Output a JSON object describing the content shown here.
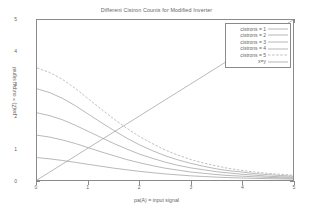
{
  "chart_data": {
    "type": "line",
    "title": "Different Cistron Counts for Modified Inverter",
    "xlabel": "pa(A) = input signal",
    "ylabel": "pa(Z) = output signal",
    "xlim": [
      0,
      5
    ],
    "ylim": [
      0,
      5
    ],
    "xticks": [
      "0",
      "1",
      "2",
      "3",
      "4",
      "5"
    ],
    "yticks": [
      "0",
      "1",
      "2",
      "3",
      "4",
      "5"
    ],
    "grid": false,
    "legend_position": "top-right",
    "x": [
      0,
      0.25,
      0.5,
      0.75,
      1,
      1.25,
      1.5,
      1.75,
      2,
      2.25,
      2.5,
      2.75,
      3,
      3.25,
      3.5,
      3.75,
      4,
      4.25,
      4.5,
      4.75,
      5
    ],
    "series": [
      {
        "name": "cistrons = 1",
        "linestyle": "solid",
        "color": "#9a9a9a",
        "values": [
          0.7,
          0.66,
          0.61,
          0.55,
          0.49,
          0.43,
          0.37,
          0.32,
          0.27,
          0.23,
          0.19,
          0.16,
          0.13,
          0.11,
          0.09,
          0.075,
          0.062,
          0.051,
          0.042,
          0.035,
          0.029
        ]
      },
      {
        "name": "cistrons = 2",
        "linestyle": "solid",
        "color": "#9a9a9a",
        "values": [
          1.4,
          1.34,
          1.25,
          1.14,
          1.01,
          0.88,
          0.76,
          0.64,
          0.54,
          0.45,
          0.37,
          0.31,
          0.25,
          0.21,
          0.17,
          0.14,
          0.12,
          0.1,
          0.082,
          0.068,
          0.057
        ]
      },
      {
        "name": "cistrons = 3",
        "linestyle": "solid",
        "color": "#9a9a9a",
        "values": [
          2.1,
          2.01,
          1.88,
          1.71,
          1.52,
          1.33,
          1.14,
          0.97,
          0.81,
          0.68,
          0.56,
          0.46,
          0.38,
          0.32,
          0.26,
          0.22,
          0.18,
          0.15,
          0.12,
          0.1,
          0.086
        ]
      },
      {
        "name": "cistrons = 4",
        "linestyle": "solid",
        "color": "#9a9a9a",
        "values": [
          2.85,
          2.73,
          2.55,
          2.32,
          2.06,
          1.8,
          1.55,
          1.31,
          1.1,
          0.92,
          0.76,
          0.63,
          0.52,
          0.43,
          0.35,
          0.29,
          0.25,
          0.2,
          0.17,
          0.14,
          0.12
        ]
      },
      {
        "name": "cistrons = 5",
        "linestyle": "dashed",
        "color": "#a5a5a5",
        "values": [
          3.5,
          3.36,
          3.14,
          2.86,
          2.54,
          2.22,
          1.91,
          1.62,
          1.36,
          1.14,
          0.94,
          0.78,
          0.64,
          0.53,
          0.44,
          0.36,
          0.3,
          0.25,
          0.21,
          0.18,
          0.15
        ]
      },
      {
        "name": "x=y",
        "linestyle": "solid",
        "color": "#9a9a9a",
        "values": [
          0,
          0.25,
          0.5,
          0.75,
          1,
          1.25,
          1.5,
          1.75,
          2,
          2.25,
          2.5,
          2.75,
          3,
          3.25,
          3.5,
          3.75,
          4,
          4.25,
          4.5,
          4.75,
          5
        ]
      }
    ]
  }
}
